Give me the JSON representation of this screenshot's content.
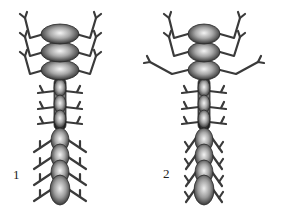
{
  "figure": {
    "panels": [
      {
        "label": "1",
        "center_x": 60
      },
      {
        "label": "2",
        "center_x": 204
      }
    ]
  },
  "colors": {
    "background": "#ffffff",
    "body_dark": "#1e1e1e",
    "body_light": "#f0f0f0",
    "legs": "#3a3a3a",
    "label": "#222222"
  }
}
